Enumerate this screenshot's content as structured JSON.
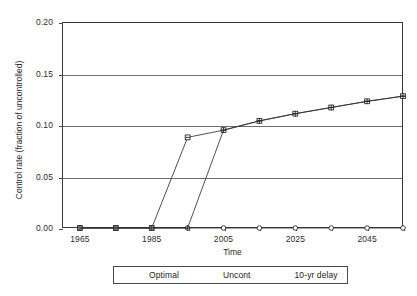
{
  "chart_data": {
    "type": "line",
    "title": "",
    "xlabel": "Time",
    "ylabel": "Control rate (fraction of uncontrolled)",
    "xlim": [
      1960,
      2055
    ],
    "ylim": [
      0.0,
      0.2
    ],
    "grid": true,
    "legend_position": "bottom-center",
    "y_ticks": [
      "0.00",
      "0.05",
      "0.10",
      "0.15",
      "0.20"
    ],
    "y_tick_values": [
      0.0,
      0.05,
      0.1,
      0.15,
      0.2
    ],
    "x_tick_values": [
      1965,
      1975,
      1985,
      1995,
      2005,
      2015,
      2025,
      2035,
      2045,
      2055
    ],
    "x_tick_labels": [
      "1965",
      "",
      "1985",
      "",
      "2005",
      "",
      "2025",
      "",
      "2045",
      ""
    ],
    "x_labeled": [
      "1965",
      "1985",
      "2005",
      "2025",
      "2045"
    ],
    "categories": [
      1965,
      1975,
      1985,
      1995,
      2005,
      2015,
      2025,
      2035,
      2045,
      2055
    ],
    "series": [
      {
        "name": "Optimal",
        "marker": "square",
        "values": [
          0.0,
          0.0,
          0.0,
          0.088,
          0.095,
          0.104,
          0.111,
          0.117,
          0.123,
          0.128
        ]
      },
      {
        "name": "Uncont",
        "marker": "circle",
        "values": [
          0.0,
          0.0,
          0.0,
          0.0,
          0.0,
          0.0,
          0.0,
          0.0,
          0.0,
          0.0
        ]
      },
      {
        "name": "10-yr delay",
        "marker": "cross",
        "values": [
          0.0,
          0.0,
          0.0,
          0.0,
          0.095,
          0.104,
          0.111,
          0.117,
          0.123,
          0.128
        ]
      }
    ]
  },
  "legend": {
    "items": [
      {
        "label": "Optimal"
      },
      {
        "label": "Uncont"
      },
      {
        "label": "10-yr delay"
      }
    ]
  },
  "colors": {
    "line": "#2f2f2f",
    "grid": "#6e6e6e",
    "axis": "#3a3a3a",
    "text": "#2b2b2b",
    "background": "#ffffff"
  }
}
